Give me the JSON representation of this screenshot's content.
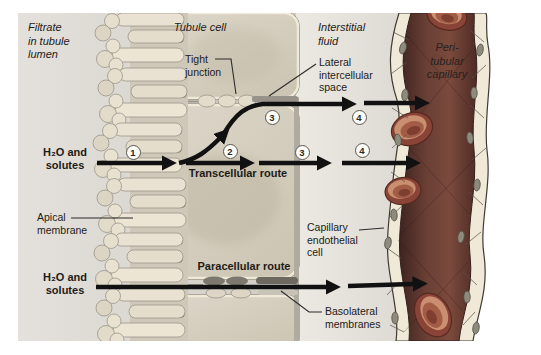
{
  "figure": {
    "title_semantic": "Transcellular and paracellular reabsorption routes from tubule lumen to peritubular capillary",
    "regions": {
      "filtrate_lumen": "Filtrate\nin tubule\nlumen",
      "tubule_cell": "Tubule cell",
      "interstitial_fluid": "Interstitial\nfluid",
      "peritubular_capillary": "Peri-\ntubular\ncapillary"
    },
    "structures": {
      "tight_junction": "Tight\njunction",
      "lateral_intercellular_space": "Lateral\nintercellular\nspace",
      "apical_membrane": "Apical\nmembrane",
      "capillary_endothelial_cell": "Capillary\nendothelial\ncell",
      "basolateral_membranes": "Basolateral\nmembranes"
    },
    "routes": {
      "transcellular_label": "Transcellular route",
      "paracellular_label": "Paracellular route",
      "input_top": "H₂O and\nsolutes",
      "input_bottom": "H₂O and\nsolutes"
    },
    "steps": {
      "transcellular": [
        "1",
        "2",
        "3",
        "4"
      ],
      "lateral": [
        "3",
        "4"
      ]
    },
    "colors": {
      "lumen": "#d9d5cf",
      "cell": "#d6cfc0",
      "interstitial": "#e8e5de",
      "capillary_lumen": "#5c3530",
      "red_blood_cell": "#9a4f40",
      "vessel_wall": "#f0e9d8",
      "arrow": "#111111"
    }
  }
}
